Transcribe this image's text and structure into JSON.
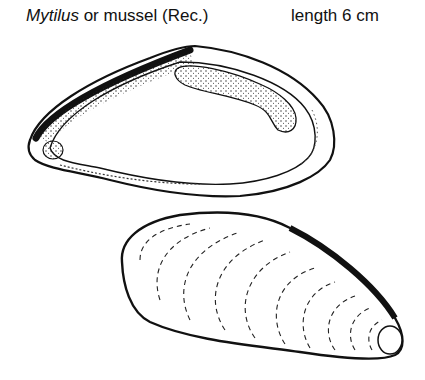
{
  "caption": {
    "genus": "Mytilus",
    "rest": " or mussel (Rec.)",
    "length": "length 6 cm"
  },
  "figures": [
    {
      "name": "interior-view",
      "label": "Interior of left valve showing muscle scars and pallial line"
    },
    {
      "name": "exterior-view",
      "label": "Exterior of valve showing growth lines"
    }
  ]
}
